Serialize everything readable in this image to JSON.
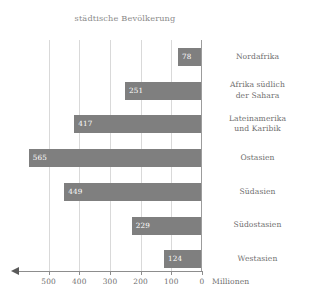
{
  "chart_data": {
    "type": "bar",
    "orientation": "horizontal",
    "title": "städtische Bevölkerung",
    "xlabel": "Millionen",
    "ylabel": "",
    "xlim": [
      600,
      0
    ],
    "x_axis_reversed": true,
    "grid": true,
    "legend": "none",
    "bar_color": "#7f7f7f",
    "gridline_color": "#d9d9d9",
    "zero_line_color": "#9c9c9c",
    "text_color": "#6f6f6f",
    "value_label_color": "#ffffff",
    "xticks": [
      500,
      400,
      300,
      200,
      100,
      0
    ],
    "xtick_labels": [
      "500",
      "400",
      "300",
      "200",
      "100",
      "0"
    ],
    "categories": [
      "Nordafrika",
      "Afrika südlich der Sahara",
      "Lateinamerika und Karibik",
      "Ostasien",
      "Südasien",
      "Südostasien",
      "Westasien"
    ],
    "values": [
      78,
      251,
      417,
      565,
      449,
      229,
      124
    ],
    "bars": [
      {
        "category": "Nordafrika",
        "category_lines": [
          "Nordafrika"
        ],
        "value": 78,
        "value_label": "78"
      },
      {
        "category": "Afrika südlich der Sahara",
        "category_lines": [
          "Afrika südlich",
          "der Sahara"
        ],
        "value": 251,
        "value_label": "251"
      },
      {
        "category": "Lateinamerika und Karibik",
        "category_lines": [
          "Lateinamerika",
          "und Karibik"
        ],
        "value": 417,
        "value_label": "417"
      },
      {
        "category": "Ostasien",
        "category_lines": [
          "Ostasien"
        ],
        "value": 565,
        "value_label": "565"
      },
      {
        "category": "Südasien",
        "category_lines": [
          "Südasien"
        ],
        "value": 449,
        "value_label": "449"
      },
      {
        "category": "Südostasien",
        "category_lines": [
          "Südostasien"
        ],
        "value": 229,
        "value_label": "229"
      },
      {
        "category": "Westasien",
        "category_lines": [
          "Westasien"
        ],
        "value": 124,
        "value_label": "124"
      }
    ]
  },
  "axis": {
    "unit_label": "Millionen",
    "tick_labels": [
      "500",
      "400",
      "300",
      "200",
      "100",
      "0"
    ]
  }
}
